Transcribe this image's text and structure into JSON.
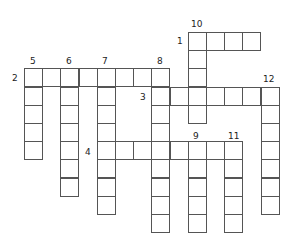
{
  "puzzle": {
    "type": "crossword",
    "cell_size": 18.2,
    "origin": {
      "x": 24,
      "y": 32
    },
    "words": [
      {
        "number": "1",
        "direction": "across",
        "col": 9,
        "row": 0,
        "length": 4,
        "label_pos": {
          "x": 177,
          "y": 36
        }
      },
      {
        "number": "2",
        "direction": "across",
        "col": 0,
        "row": 2,
        "length": 8,
        "label_pos": {
          "x": 12,
          "y": 73
        }
      },
      {
        "number": "3",
        "direction": "across",
        "col": 7,
        "row": 3,
        "length": 7,
        "label_pos": {
          "x": 140,
          "y": 92
        }
      },
      {
        "number": "4",
        "direction": "across",
        "col": 4,
        "row": 6,
        "length": 8,
        "label_pos": {
          "x": 85,
          "y": 147
        }
      },
      {
        "number": "5",
        "direction": "down",
        "col": 0,
        "row": 2,
        "length": 5,
        "label_pos": {
          "x": 30,
          "y": 56
        }
      },
      {
        "number": "6",
        "direction": "down",
        "col": 2,
        "row": 2,
        "length": 7,
        "label_pos": {
          "x": 66,
          "y": 56
        }
      },
      {
        "number": "7",
        "direction": "down",
        "col": 4,
        "row": 2,
        "length": 8,
        "label_pos": {
          "x": 102,
          "y": 56
        }
      },
      {
        "number": "8",
        "direction": "down",
        "col": 7,
        "row": 2,
        "length": 9,
        "label_pos": {
          "x": 157,
          "y": 56
        }
      },
      {
        "number": "9",
        "direction": "down",
        "col": 9,
        "row": 6,
        "length": 5,
        "label_pos": {
          "x": 193,
          "y": 131
        }
      },
      {
        "number": "10",
        "direction": "down",
        "col": 9,
        "row": 0,
        "length": 5,
        "label_pos": {
          "x": 191,
          "y": 19
        }
      },
      {
        "number": "11",
        "direction": "down",
        "col": 11,
        "row": 6,
        "length": 5,
        "label_pos": {
          "x": 228,
          "y": 131
        }
      },
      {
        "number": "12",
        "direction": "down",
        "col": 13,
        "row": 3,
        "length": 7,
        "label_pos": {
          "x": 263,
          "y": 74
        }
      }
    ]
  }
}
